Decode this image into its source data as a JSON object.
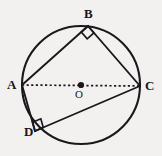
{
  "figure": {
    "kind": "circle-geometry-diagram",
    "background_color": "#f3f1ef",
    "stroke_color": "#1a181c",
    "labels": {
      "A": "A",
      "B": "B",
      "C": "C",
      "D": "D",
      "O": "O"
    },
    "circle": {
      "center_x": 81,
      "center_y": 85,
      "radius": 59,
      "stroke_width": 2.1
    },
    "points": {
      "A": {
        "x": 22,
        "y": 85
      },
      "B": {
        "x": 88,
        "y": 26
      },
      "C": {
        "x": 140,
        "y": 86
      },
      "D": {
        "x": 35,
        "y": 131
      },
      "O": {
        "x": 81,
        "y": 85
      }
    },
    "center_dot": {
      "x": 81,
      "y": 85,
      "radius": 3.1
    },
    "segments": [
      {
        "name": "AB",
        "from": "A",
        "to": "B",
        "style": "solid",
        "stroke_width": 1.9
      },
      {
        "name": "BC",
        "from": "B",
        "to": "C",
        "style": "solid",
        "stroke_width": 1.9
      },
      {
        "name": "AD",
        "from": "A",
        "to": "D",
        "style": "solid",
        "stroke_width": 1.9
      },
      {
        "name": "DC",
        "from": "D",
        "to": "C",
        "style": "solid",
        "stroke_width": 1.9
      },
      {
        "name": "AC",
        "from": "A",
        "to": "C",
        "style": "dashed",
        "stroke_width": 1.7,
        "dash_pattern": "2.2 2.4"
      }
    ],
    "right_angle_marks": [
      {
        "at": "B",
        "size": 9
      },
      {
        "at": "D",
        "size": 9
      }
    ]
  }
}
